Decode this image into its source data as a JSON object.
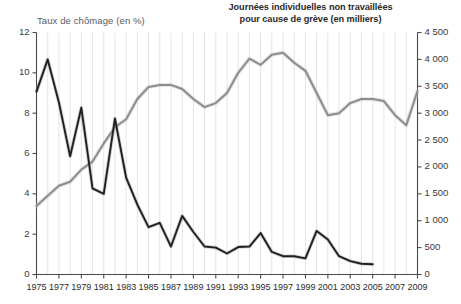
{
  "titles": {
    "left_axis_title": "Taux de chômage (en %)",
    "right_axis_title_line1": "Journées individuelles non travaillées",
    "right_axis_title_line2": "pour cause de grève (en milliers)"
  },
  "colors": {
    "unemployment_line": "#8c8c8c",
    "strikes_line": "#231f20",
    "gridline": "#d9dde4",
    "axis": "#4a4a4a",
    "text": "#3a3a3a"
  },
  "chart_data": {
    "type": "line",
    "title": "",
    "xlabel": "",
    "grid": true,
    "legend_position": "none",
    "x": [
      1975,
      1976,
      1977,
      1978,
      1979,
      1980,
      1981,
      1982,
      1983,
      1984,
      1985,
      1986,
      1987,
      1988,
      1989,
      1990,
      1991,
      1992,
      1993,
      1994,
      1995,
      1996,
      1997,
      1998,
      1999,
      2000,
      2001,
      2002,
      2003,
      2004,
      2005,
      2006,
      2007,
      2008,
      2009
    ],
    "x_tick_labels": [
      "1975",
      "1977",
      "1979",
      "1981",
      "1983",
      "1985",
      "1987",
      "1989",
      "1991",
      "1993",
      "1995",
      "1997",
      "1999",
      "2001",
      "2003",
      "2005",
      "2007",
      "2009"
    ],
    "axes": {
      "left": {
        "label": "Taux de chômage (en %)",
        "ylim": [
          0,
          12
        ],
        "ticks": [
          0,
          2,
          4,
          6,
          8,
          10,
          12
        ],
        "tick_labels": [
          "0",
          "2",
          "4",
          "6",
          "8",
          "10",
          "12"
        ]
      },
      "right": {
        "label": "Journées individuelles non travaillées pour cause de grève (en milliers)",
        "ylim": [
          0,
          4500
        ],
        "ticks": [
          0,
          500,
          1000,
          1500,
          2000,
          2500,
          3000,
          3500,
          4000,
          4500
        ],
        "tick_labels": [
          "0",
          "500",
          "1 000",
          "1 500",
          "2 000",
          "2 500",
          "3 000",
          "3 500",
          "4 000",
          "4 500"
        ]
      }
    },
    "series": [
      {
        "name": "Taux de chômage (en %)",
        "axis": "left",
        "color": "#8c8c8c",
        "x": [
          1975,
          1976,
          1977,
          1978,
          1979,
          1980,
          1981,
          1982,
          1983,
          1984,
          1985,
          1986,
          1987,
          1988,
          1989,
          1990,
          1991,
          1992,
          1993,
          1994,
          1995,
          1996,
          1997,
          1998,
          1999,
          2000,
          2001,
          2002,
          2003,
          2004,
          2005,
          2006,
          2007,
          2008,
          2009
        ],
        "values": [
          3.4,
          3.9,
          4.4,
          4.6,
          5.2,
          5.6,
          6.5,
          7.3,
          7.7,
          8.7,
          9.3,
          9.4,
          9.4,
          9.2,
          8.7,
          8.3,
          8.5,
          9.0,
          10.0,
          10.7,
          10.4,
          10.9,
          11.0,
          10.5,
          10.1,
          9.0,
          7.9,
          8.0,
          8.5,
          8.7,
          8.7,
          8.6,
          7.9,
          7.4,
          9.1
        ]
      },
      {
        "name": "Journées individuelles non travaillées pour cause de grève (en milliers)",
        "axis": "right",
        "color": "#231f20",
        "x": [
          1975,
          1976,
          1977,
          1978,
          1979,
          1980,
          1981,
          1982,
          1983,
          1984,
          1985,
          1986,
          1987,
          1988,
          1989,
          1990,
          1991,
          1992,
          1993,
          1994,
          1995,
          1996,
          1997,
          1998,
          1999,
          2000,
          2001,
          2002,
          2003,
          2004,
          2005
        ],
        "values": [
          3400,
          4000,
          3200,
          2200,
          3100,
          1600,
          1500,
          2900,
          1800,
          1300,
          880,
          960,
          520,
          1090,
          790,
          520,
          500,
          390,
          510,
          520,
          770,
          420,
          340,
          340,
          300,
          810,
          650,
          340,
          250,
          200,
          190
        ]
      }
    ]
  }
}
